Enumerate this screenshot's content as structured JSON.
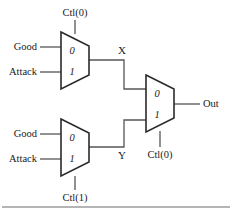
{
  "figure": {
    "line_color": "#555555",
    "shape_stroke": "#2b2b2b",
    "background": "#ffffff"
  },
  "muxes": [
    {
      "id": "mux-top-left",
      "port_labels": [
        "0",
        "1"
      ],
      "inputs": [
        {
          "label": "Good"
        },
        {
          "label": "Attack"
        }
      ],
      "control": {
        "label": "Ctl(0)",
        "position": "top"
      },
      "output": {
        "label": "X"
      }
    },
    {
      "id": "mux-bottom-left",
      "port_labels": [
        "0",
        "1"
      ],
      "inputs": [
        {
          "label": "Good"
        },
        {
          "label": "Attack"
        }
      ],
      "control": {
        "label": "Ctl(1)",
        "position": "bottom"
      },
      "output": {
        "label": "Y"
      }
    },
    {
      "id": "mux-right",
      "port_labels": [
        "0",
        "1"
      ],
      "inputs": [
        {
          "label": "X"
        },
        {
          "label": "Y"
        }
      ],
      "control": {
        "label": "Ctl(0)",
        "position": "bottom"
      },
      "output": {
        "label": "Out"
      }
    }
  ],
  "labels": {
    "good_top": "Good",
    "attack_top": "Attack",
    "good_bottom": "Good",
    "attack_bottom": "Attack",
    "ctl_top": "Ctl(0)",
    "ctl_bottom": "Ctl(1)",
    "ctl_right": "Ctl(0)",
    "node_x": "X",
    "node_y": "Y",
    "out": "Out",
    "port_zero_top": "0",
    "port_one_top": "1",
    "port_zero_bottom": "0",
    "port_one_bottom": "1",
    "port_zero_right": "0",
    "port_one_right": "1"
  }
}
